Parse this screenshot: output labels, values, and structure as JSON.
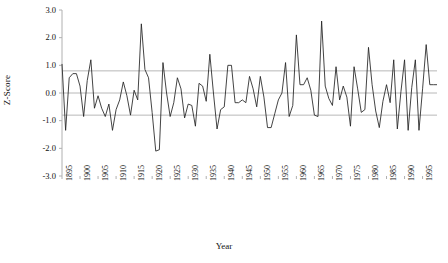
{
  "chart_data": {
    "type": "line",
    "title": "",
    "xlabel": "Year",
    "ylabel": "Z-Score",
    "xlim": [
      1895,
      1999
    ],
    "ylim": [
      -3.0,
      3.0
    ],
    "grid": true,
    "legend": "none",
    "y_ticks": [
      "3.0",
      "2.0",
      "1.0",
      "0.0",
      "-1.0",
      "-2.0",
      "-3.0"
    ],
    "y_tick_values": [
      3.0,
      2.0,
      1.0,
      0.0,
      -1.0,
      -2.0,
      -3.0
    ],
    "x_ticks": [
      "1895",
      "1900",
      "1905",
      "1910",
      "1915",
      "1920",
      "1925",
      "1930",
      "1935",
      "1940",
      "1945",
      "1950",
      "1955",
      "1960",
      "1965",
      "1970",
      "1975",
      "1980",
      "1985",
      "1990",
      "1995"
    ],
    "x_tick_values": [
      1895,
      1900,
      1905,
      1910,
      1915,
      1920,
      1925,
      1930,
      1935,
      1940,
      1945,
      1950,
      1955,
      1960,
      1965,
      1970,
      1975,
      1980,
      1985,
      1990,
      1995
    ],
    "reference_lines": [
      {
        "value": 0.8,
        "label": "upper-threshold",
        "color": "#b8b8b8"
      },
      {
        "value": 0.0,
        "label": "zero-line",
        "color": "#b8b8b8"
      },
      {
        "value": -0.8,
        "label": "lower-threshold",
        "color": "#b8b8b8"
      }
    ],
    "series": [
      {
        "name": "Z-Score",
        "color": "#222222",
        "x": [
          1895,
          1896,
          1897,
          1898,
          1899,
          1900,
          1901,
          1902,
          1903,
          1904,
          1905,
          1906,
          1907,
          1908,
          1909,
          1910,
          1911,
          1912,
          1913,
          1914,
          1915,
          1916,
          1917,
          1918,
          1919,
          1920,
          1921,
          1922,
          1923,
          1924,
          1925,
          1926,
          1927,
          1928,
          1929,
          1930,
          1931,
          1932,
          1933,
          1934,
          1935,
          1936,
          1937,
          1938,
          1939,
          1940,
          1941,
          1942,
          1943,
          1944,
          1945,
          1946,
          1947,
          1948,
          1949,
          1950,
          1951,
          1952,
          1953,
          1954,
          1955,
          1956,
          1957,
          1958,
          1959,
          1960,
          1961,
          1962,
          1963,
          1964,
          1965,
          1966,
          1967,
          1968,
          1969,
          1970,
          1971,
          1972,
          1973,
          1974,
          1975,
          1976,
          1977,
          1978,
          1979,
          1980,
          1981,
          1982,
          1983,
          1984,
          1985,
          1986,
          1987,
          1988,
          1989,
          1990,
          1991,
          1992,
          1993,
          1994,
          1995,
          1996,
          1997,
          1998,
          1999
        ],
        "values": [
          1.05,
          -1.35,
          0.55,
          0.7,
          0.7,
          0.25,
          -0.85,
          0.45,
          1.2,
          -0.55,
          -0.1,
          -0.55,
          -0.85,
          -0.4,
          -1.35,
          -0.6,
          -0.25,
          0.4,
          -0.1,
          -0.8,
          0.1,
          -0.25,
          2.5,
          0.85,
          0.55,
          -0.7,
          -2.1,
          -2.05,
          1.1,
          0.0,
          -0.85,
          -0.35,
          0.55,
          0.15,
          -0.9,
          -0.4,
          -0.45,
          -1.2,
          0.35,
          0.25,
          -0.3,
          1.4,
          0.0,
          -1.3,
          -0.6,
          -0.5,
          1.0,
          1.0,
          -0.35,
          -0.35,
          -0.25,
          -0.35,
          0.6,
          0.15,
          -0.5,
          0.6,
          -0.15,
          -1.25,
          -1.25,
          -0.75,
          -0.25,
          0.0,
          1.1,
          -0.85,
          -0.45,
          2.1,
          0.3,
          0.3,
          0.55,
          0.1,
          -0.8,
          -0.85,
          2.6,
          0.25,
          -0.2,
          -0.45,
          0.95,
          -0.25,
          0.25,
          -0.15,
          -1.2,
          0.95,
          0.15,
          -0.7,
          -0.6,
          1.65,
          0.3,
          -0.65,
          -1.25,
          -0.3,
          0.3,
          -0.35,
          1.2,
          -1.3,
          0.05,
          1.2,
          -1.35,
          0.2,
          1.2,
          -1.35,
          0.15,
          1.75,
          0.3,
          0.3,
          0.3
        ]
      }
    ]
  }
}
